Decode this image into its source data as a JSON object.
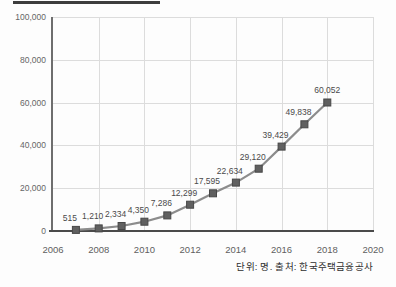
{
  "caption": "단위: 명. 출처: 한국주택금융공사",
  "chart_data": {
    "type": "line",
    "title": "",
    "x": [
      2007,
      2008,
      2009,
      2010,
      2011,
      2012,
      2013,
      2014,
      2015,
      2016,
      2017,
      2018
    ],
    "values": [
      515,
      1210,
      2334,
      4350,
      7286,
      12299,
      17595,
      22634,
      29120,
      39429,
      49838,
      60052
    ],
    "point_labels": [
      "515",
      "1,210",
      "2,334",
      "4,350",
      "7,286",
      "12,299",
      "17,595",
      "22,634",
      "29,120",
      "39,429",
      "49,838",
      "60,052"
    ],
    "x_tick_values": [
      2006,
      2008,
      2010,
      2012,
      2014,
      2016,
      2018,
      2020
    ],
    "x_tick_labels": [
      "2006",
      "2008",
      "2010",
      "2012",
      "2014",
      "2016",
      "2018",
      "2020"
    ],
    "y_tick_values": [
      0,
      20000,
      40000,
      60000,
      80000,
      100000
    ],
    "y_tick_labels": [
      "0",
      "20,000",
      "40,000",
      "60,000",
      "80,000",
      "100,000"
    ],
    "x_range": [
      2006,
      2020
    ],
    "y_range": [
      0,
      100000
    ],
    "grid": true,
    "legend": "none",
    "line_color": "#8c8c8c",
    "marker_color": "#606060",
    "marker_border_color": "#474747"
  }
}
